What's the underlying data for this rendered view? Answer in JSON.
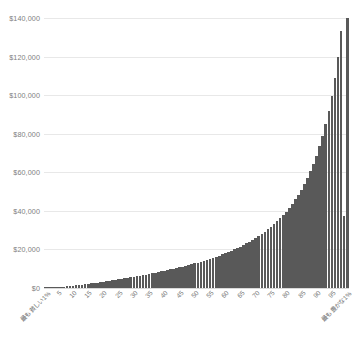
{
  "chart_data": {
    "type": "bar",
    "title": "",
    "xlabel": "",
    "ylabel": "",
    "ylim": [
      0,
      140000
    ],
    "ytick_labels": [
      "$140,000",
      "$120,000",
      "$100,000",
      "$80,000",
      "$60,000",
      "$40,000",
      "$20,000",
      "$0"
    ],
    "ytick_values": [
      140000,
      120000,
      100000,
      80000,
      60000,
      40000,
      20000,
      0
    ],
    "grid": true,
    "legend": "none",
    "xtick_labels": [
      "最も貧しい1%",
      "5",
      "10",
      "15",
      "20",
      "25",
      "30",
      "35",
      "40",
      "45",
      "50",
      "55",
      "60",
      "65",
      "70",
      "75",
      "80",
      "85",
      "90",
      "95",
      "最も豊かな1%"
    ],
    "categories": [
      "最も貧しい1%",
      "2",
      "3",
      "4",
      "5",
      "6",
      "7",
      "8",
      "9",
      "10",
      "11",
      "12",
      "13",
      "14",
      "15",
      "16",
      "17",
      "18",
      "19",
      "20",
      "21",
      "22",
      "23",
      "24",
      "25",
      "26",
      "27",
      "28",
      "29",
      "30",
      "31",
      "32",
      "33",
      "34",
      "35",
      "36",
      "37",
      "38",
      "39",
      "40",
      "41",
      "42",
      "43",
      "44",
      "45",
      "46",
      "47",
      "48",
      "49",
      "50",
      "51",
      "52",
      "53",
      "54",
      "55",
      "56",
      "57",
      "58",
      "59",
      "60",
      "61",
      "62",
      "63",
      "64",
      "65",
      "66",
      "67",
      "68",
      "69",
      "70",
      "71",
      "72",
      "73",
      "74",
      "75",
      "76",
      "77",
      "78",
      "79",
      "80",
      "81",
      "82",
      "83",
      "84",
      "85",
      "86",
      "87",
      "88",
      "89",
      "90",
      "91",
      "92",
      "93",
      "94",
      "95",
      "96",
      "97",
      "98",
      "99",
      "最も豊かな1%"
    ],
    "values": [
      60,
      120,
      200,
      300,
      420,
      560,
      700,
      860,
      1020,
      1200,
      1380,
      1560,
      1760,
      1960,
      2160,
      2380,
      2600,
      2820,
      3050,
      3280,
      3520,
      3760,
      4000,
      4250,
      4500,
      4760,
      5020,
      5290,
      5560,
      5840,
      6120,
      6410,
      6700,
      7000,
      7300,
      7610,
      7930,
      8250,
      8580,
      8920,
      9260,
      9610,
      9970,
      10340,
      10720,
      11110,
      11510,
      11920,
      12340,
      12780,
      13230,
      13690,
      14170,
      14660,
      15170,
      15700,
      16250,
      16820,
      17410,
      18020,
      18660,
      19330,
      20030,
      20760,
      21520,
      22320,
      23160,
      24040,
      24970,
      25950,
      26980,
      28070,
      29220,
      30440,
      31740,
      33120,
      34590,
      36160,
      37840,
      39640,
      41580,
      43670,
      45930,
      48380,
      51040,
      53940,
      57110,
      60590,
      64430,
      68690,
      73440,
      78770,
      84800,
      91680,
      99620,
      108900,
      119950,
      133330,
      37500,
      143000
    ],
    "bar_color": "#595959",
    "gridline_color": "#e8e8e8",
    "background_color": "#ffffff"
  }
}
